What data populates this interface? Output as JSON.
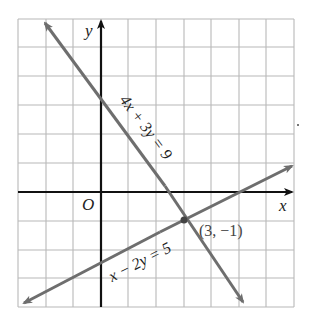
{
  "figure": {
    "axis_labels": {
      "x": "x",
      "y": "y",
      "origin": "O"
    },
    "grid": {
      "x_min": -3,
      "x_max": 7,
      "y_min": -4,
      "y_max": 6,
      "step": 1
    },
    "lines": [
      {
        "id": "line1",
        "equation": "4x + 3y = 9",
        "color": "#6e6e6e"
      },
      {
        "id": "line2",
        "equation": "x − 2y = 5",
        "color": "#6e6e6e"
      }
    ],
    "intersection": {
      "x": 3,
      "y": -1,
      "label": "(3, −1)"
    },
    "colors": {
      "axes": "#111111",
      "grid": "#b8b8b8",
      "lines": "#6e6e6e"
    }
  }
}
